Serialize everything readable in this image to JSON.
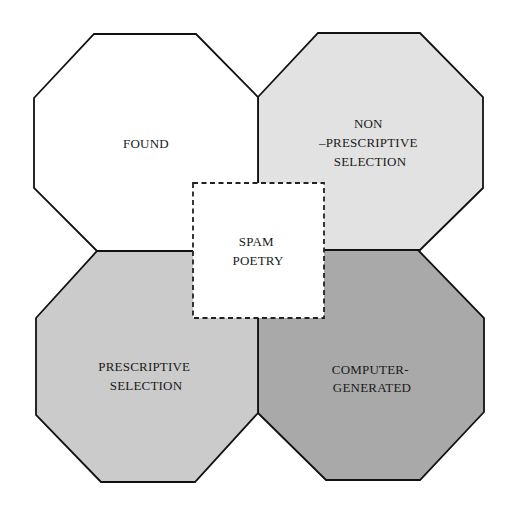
{
  "diagram": {
    "type": "overlapping-octagons",
    "center": {
      "label_line1": "SPAM",
      "label_line2": "POETRY",
      "border_style": "dashed",
      "fill": "#ffffff"
    },
    "regions": [
      {
        "id": "found",
        "position": "top-left",
        "lines": [
          "FOUND"
        ],
        "fill": "#ffffff"
      },
      {
        "id": "non-prescriptive-selection",
        "position": "top-right",
        "lines": [
          "NON",
          "–PRESCRIPTIVE",
          "SELECTION"
        ],
        "fill": "#e2e2e2"
      },
      {
        "id": "prescriptive-selection",
        "position": "bottom-left",
        "lines": [
          "PRESCRIPTIVE",
          "SELECTION"
        ],
        "fill": "#cbcbcb"
      },
      {
        "id": "computer-generated",
        "position": "bottom-right",
        "lines": [
          "COMPUTER-",
          "GENERATED"
        ],
        "fill": "#a9a9a9"
      }
    ]
  },
  "colors": {
    "stroke": "#111111",
    "background": "#ffffff"
  }
}
